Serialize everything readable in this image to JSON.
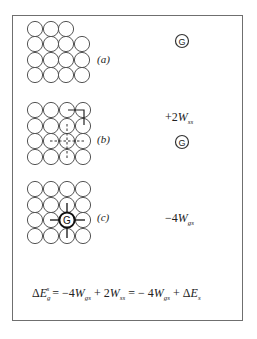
{
  "figure": {
    "panels": [
      {
        "label": "(a)",
        "rows": [
          3,
          4,
          4,
          4
        ],
        "term": "",
        "term_sub": "",
        "term_prefix": ""
      },
      {
        "label": "(b)",
        "rows": [
          4,
          4,
          4,
          4
        ],
        "term_prefix": "+2",
        "term_var": "W",
        "term_sub": "ss"
      },
      {
        "label": "(c)",
        "rows": [
          4,
          4,
          4,
          4
        ],
        "term_prefix": "−4",
        "term_var": "W",
        "term_sub": "gs"
      }
    ],
    "gas_atom_symbol": "G",
    "equation": {
      "lhs_delta": "Δ",
      "lhs_var": "E",
      "lhs_sub": "g",
      "lhs_sup": "s",
      "part1": " = −4",
      "w1": "W",
      "w1_sub": "gs",
      "part2": " + 2",
      "w2": "W",
      "w2_sub": "ss",
      "part3": " = − 4",
      "w3": "W",
      "w3_sub": "gs",
      "part4": " + Δ",
      "e_var": "E",
      "e_sub": "s"
    }
  }
}
